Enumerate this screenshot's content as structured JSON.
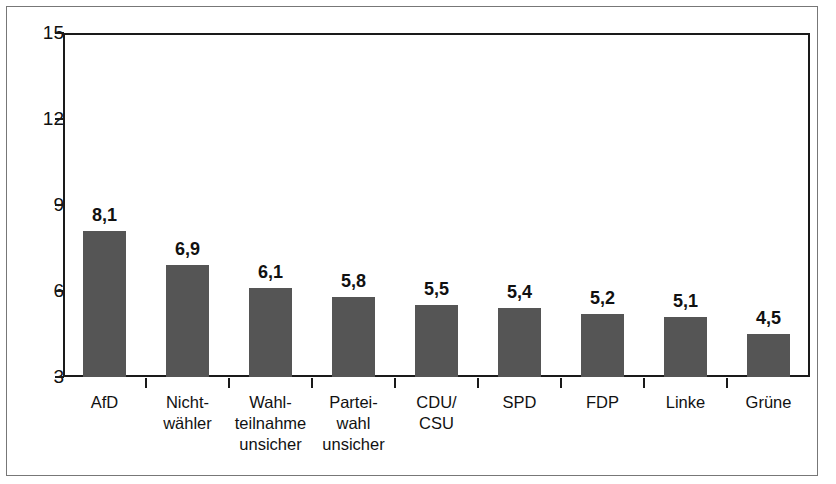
{
  "chart_data": {
    "type": "bar",
    "title": "",
    "subtitle": "",
    "xlabel": "",
    "ylabel": "",
    "ylim": [
      3,
      15
    ],
    "yticks": [
      3,
      6,
      9,
      12,
      15
    ],
    "ytick_labels": [
      "3",
      "6",
      "9",
      "12",
      "15"
    ],
    "grid": false,
    "legend": "none",
    "decimal_separator": ",",
    "bar_color": "#555555",
    "axis_color": "#1a1a1a",
    "frame_color": "#777777",
    "background_color": "#ffffff",
    "categories": [
      "AfD",
      "Nicht-wähler",
      "Wahl-teilnahme unsicher",
      "Partei-wahl unsicher",
      "CDU/CSU",
      "SPD",
      "FDP",
      "Linke",
      "Grüne"
    ],
    "category_label_lines": [
      [
        "AfD"
      ],
      [
        "Nicht-",
        "wähler"
      ],
      [
        "Wahl-",
        "teilnahme",
        "unsicher"
      ],
      [
        "Partei-",
        "wahl",
        "unsicher"
      ],
      [
        "CDU/",
        "CSU"
      ],
      [
        "SPD"
      ],
      [
        "FDP"
      ],
      [
        "Linke"
      ],
      [
        "Grüne"
      ]
    ],
    "values": [
      8.1,
      6.9,
      6.1,
      5.8,
      5.5,
      5.4,
      5.2,
      5.1,
      4.5
    ],
    "value_labels": [
      "8,1",
      "6,9",
      "6,1",
      "5,8",
      "5,5",
      "5,4",
      "5,2",
      "5,1",
      "4,5"
    ]
  }
}
